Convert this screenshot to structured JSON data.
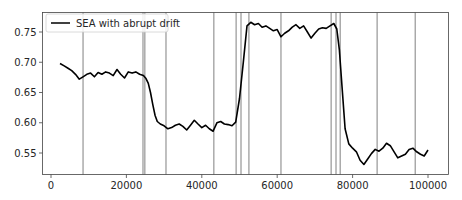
{
  "chart_data": {
    "type": "line",
    "title": "",
    "xlabel": "",
    "ylabel": "",
    "xlim": [
      -2500,
      105000
    ],
    "ylim": [
      0.513,
      0.782
    ],
    "grid": false,
    "legend_position": "upper left",
    "x_ticks": [
      0,
      20000,
      40000,
      60000,
      80000,
      100000
    ],
    "x_tick_labels": [
      "0",
      "20000",
      "40000",
      "60000",
      "80000",
      "100000"
    ],
    "y_ticks": [
      0.55,
      0.6,
      0.65,
      0.7,
      0.75
    ],
    "y_tick_labels": [
      "0.55",
      "0.60",
      "0.65",
      "0.70",
      "0.75"
    ],
    "series": [
      {
        "name": "SEA with abrupt drift",
        "color": "#000000",
        "x": [
          2400,
          3500,
          4500,
          5500,
          6500,
          7500,
          8500,
          9500,
          10500,
          11500,
          12500,
          13500,
          14500,
          15500,
          16500,
          17500,
          18500,
          19500,
          20500,
          21500,
          22500,
          23500,
          24500,
          25200,
          25800,
          26400,
          27000,
          27600,
          28200,
          29000,
          30000,
          31000,
          32000,
          33000,
          34000,
          35000,
          36000,
          37000,
          38000,
          39000,
          40000,
          41000,
          42000,
          43000,
          44000,
          45000,
          46000,
          47000,
          48000,
          49000,
          50000,
          51000,
          52000,
          53000,
          54000,
          55000,
          56000,
          57000,
          58000,
          59000,
          60000,
          61000,
          62000,
          63000,
          64000,
          65000,
          66000,
          67000,
          68000,
          69000,
          70000,
          71000,
          72000,
          73000,
          74000,
          75000,
          75800,
          76500,
          77200,
          78000,
          79000,
          80000,
          81000,
          82000,
          83000,
          84000,
          85000,
          86000,
          87000,
          88000,
          89000,
          90000,
          91000,
          92000,
          93000,
          94000,
          95000,
          96000,
          97000,
          98000,
          99000,
          100000
        ],
        "values": [
          0.698,
          0.694,
          0.69,
          0.686,
          0.68,
          0.672,
          0.676,
          0.68,
          0.682,
          0.676,
          0.683,
          0.68,
          0.684,
          0.682,
          0.678,
          0.688,
          0.68,
          0.674,
          0.684,
          0.682,
          0.684,
          0.68,
          0.678,
          0.673,
          0.665,
          0.65,
          0.63,
          0.612,
          0.602,
          0.598,
          0.595,
          0.59,
          0.592,
          0.596,
          0.598,
          0.594,
          0.588,
          0.596,
          0.604,
          0.598,
          0.592,
          0.596,
          0.59,
          0.586,
          0.6,
          0.602,
          0.598,
          0.597,
          0.595,
          0.601,
          0.64,
          0.7,
          0.76,
          0.766,
          0.762,
          0.764,
          0.758,
          0.76,
          0.756,
          0.752,
          0.754,
          0.742,
          0.748,
          0.752,
          0.758,
          0.762,
          0.756,
          0.76,
          0.75,
          0.74,
          0.748,
          0.755,
          0.757,
          0.756,
          0.76,
          0.764,
          0.755,
          0.72,
          0.66,
          0.59,
          0.565,
          0.558,
          0.552,
          0.538,
          0.531,
          0.54,
          0.549,
          0.556,
          0.553,
          0.558,
          0.566,
          0.562,
          0.552,
          0.542,
          0.545,
          0.548,
          0.556,
          0.558,
          0.552,
          0.548,
          0.545,
          0.555
        ]
      }
    ],
    "vertical_lines": [
      8500,
      24400,
      24900,
      30500,
      43200,
      49100,
      50400,
      52500,
      61000,
      74300,
      75600,
      76700,
      86500,
      96600
    ],
    "vertical_line_color": "#808080"
  },
  "legend": {
    "label": "SEA with abrupt drift"
  }
}
